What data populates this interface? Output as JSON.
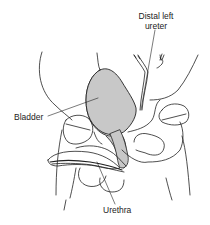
{
  "figure": {
    "labels": {
      "ureter_line1": "Distal left",
      "ureter_line2": "ureter",
      "bladder": "Bladder",
      "urethra": "Urethra"
    },
    "colors": {
      "line": "#222222",
      "bladder_fill": "#c8c8c8",
      "background": "#ffffff"
    }
  }
}
